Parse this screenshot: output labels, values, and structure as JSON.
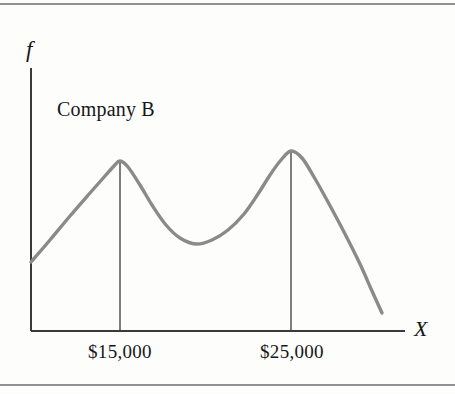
{
  "figure": {
    "background_color": "#fdfdfc",
    "rule_color": "#8f9094",
    "series_label": "Company B",
    "y_axis_label": "f",
    "x_axis_label": "X"
  },
  "chart_data": {
    "type": "line",
    "title": "Company B",
    "subtitle": "",
    "xlabel": "X",
    "ylabel": "f",
    "grid": false,
    "legend": "none",
    "annotations": [
      "Company B"
    ],
    "curve_color": "#8a8a8a",
    "axis_color": "#3a3a3c",
    "dropline_color": "#3a3a3c",
    "tick_labels": [
      "$15,000",
      "$25,000"
    ],
    "tick_positions_x": [
      120,
      292
    ],
    "droplines": [
      {
        "label": "$15,000",
        "x": 120,
        "y_top": 161,
        "y_bottom": 331
      },
      {
        "label": "$25,000",
        "x": 291,
        "y_top": 151,
        "y_bottom": 331
      }
    ],
    "axis_ranges": {
      "x_pixels": [
        31,
        405
      ],
      "y_pixels": [
        331,
        68
      ]
    },
    "key_points": [
      {
        "name": "left-start",
        "x": 31,
        "y": 262
      },
      {
        "name": "mode-1-peak",
        "x": 120,
        "y": 161
      },
      {
        "name": "trough",
        "x": 196,
        "y": 244
      },
      {
        "name": "mode-2-peak",
        "x": 291,
        "y": 151
      },
      {
        "name": "right-tail-end",
        "x": 382,
        "y": 313
      }
    ],
    "series": [
      {
        "name": "Company B frequency",
        "points": [
          [
            31,
            262
          ],
          [
            50,
            240
          ],
          [
            70,
            216
          ],
          [
            90,
            193
          ],
          [
            105,
            176
          ],
          [
            114,
            166
          ],
          [
            120,
            161
          ],
          [
            128,
            167
          ],
          [
            140,
            185
          ],
          [
            152,
            205
          ],
          [
            166,
            225
          ],
          [
            180,
            238
          ],
          [
            196,
            244
          ],
          [
            212,
            240
          ],
          [
            228,
            230
          ],
          [
            244,
            214
          ],
          [
            258,
            194
          ],
          [
            270,
            175
          ],
          [
            281,
            160
          ],
          [
            291,
            151
          ],
          [
            302,
            158
          ],
          [
            314,
            177
          ],
          [
            328,
            202
          ],
          [
            344,
            232
          ],
          [
            360,
            264
          ],
          [
            372,
            291
          ],
          [
            382,
            313
          ]
        ]
      }
    ]
  }
}
